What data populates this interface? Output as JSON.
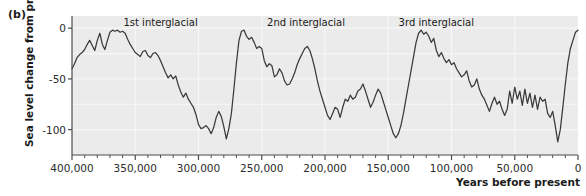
{
  "figure": {
    "panel_label": "(b)",
    "background_color": "#ffffff",
    "plot_background_color": "#ebebeb",
    "gridline_color": "#f7f7f7",
    "axis_color": "#4d4d4d",
    "line_color": "#3a3a3a"
  },
  "chart_data": {
    "type": "line",
    "title": "",
    "xlabel": "Years before present",
    "ylabel": "Sea level change from present (m)",
    "xlim": [
      400000,
      0
    ],
    "ylim": [
      -125,
      12
    ],
    "x_reversed": true,
    "grid": true,
    "legend_position": "none",
    "x_ticks": [
      400000,
      350000,
      300000,
      250000,
      200000,
      150000,
      100000,
      50000,
      0
    ],
    "x_tick_labels": [
      "400,000",
      "350,000",
      "300,000",
      "250,000",
      "200,000",
      "150,000",
      "100,000",
      "50,000",
      "0"
    ],
    "x_minor_tick_interval": 10000,
    "y_ticks": [
      0,
      -50,
      -100
    ],
    "y_tick_labels": [
      "0",
      "-50",
      "-100"
    ],
    "y_gridlines": [
      0,
      -25,
      -50,
      -75,
      -100,
      -125
    ],
    "annotations": [
      {
        "text": "1st interglacial",
        "x": 330000,
        "y": 5
      },
      {
        "text": "2nd interglacial",
        "x": 215000,
        "y": 5
      },
      {
        "text": "3rd interglacial",
        "x": 112000,
        "y": 5
      }
    ],
    "series": [
      {
        "name": "Sea level change from present",
        "units": "m",
        "x": [
          400000,
          398000,
          396000,
          394000,
          392000,
          390000,
          388000,
          386000,
          384000,
          382000,
          380000,
          378000,
          376000,
          374000,
          372000,
          370000,
          368000,
          366000,
          364000,
          362000,
          360000,
          358000,
          356000,
          354000,
          352000,
          350000,
          348000,
          346000,
          344000,
          342000,
          340000,
          338000,
          336000,
          334000,
          332000,
          330000,
          328000,
          326000,
          324000,
          322000,
          320000,
          318000,
          316000,
          314000,
          312000,
          310000,
          308000,
          306000,
          304000,
          302000,
          300000,
          298000,
          296000,
          294000,
          292000,
          290000,
          288000,
          286000,
          284000,
          282000,
          280000,
          278000,
          276000,
          274000,
          272000,
          270000,
          268000,
          266000,
          264000,
          262000,
          260000,
          258000,
          256000,
          254000,
          252000,
          250000,
          248000,
          246000,
          244000,
          242000,
          240000,
          238000,
          236000,
          234000,
          232000,
          230000,
          228000,
          226000,
          224000,
          222000,
          220000,
          218000,
          216000,
          214000,
          212000,
          210000,
          208000,
          206000,
          204000,
          202000,
          200000,
          198000,
          196000,
          194000,
          192000,
          190000,
          188000,
          186000,
          184000,
          182000,
          180000,
          178000,
          176000,
          174000,
          172000,
          170000,
          168000,
          166000,
          164000,
          162000,
          160000,
          158000,
          156000,
          154000,
          152000,
          150000,
          148000,
          146000,
          144000,
          142000,
          140000,
          138000,
          136000,
          134000,
          132000,
          130000,
          128000,
          126000,
          124000,
          122000,
          120000,
          118000,
          116000,
          114000,
          112000,
          110000,
          108000,
          106000,
          104000,
          102000,
          100000,
          98000,
          96000,
          94000,
          92000,
          90000,
          88000,
          86000,
          84000,
          82000,
          80000,
          78000,
          76000,
          74000,
          72000,
          70000,
          68000,
          66000,
          64000,
          62000,
          60000,
          58000,
          56000,
          54000,
          52000,
          50000,
          48000,
          46000,
          44000,
          42000,
          40000,
          38000,
          36000,
          34000,
          32000,
          30000,
          28000,
          26000,
          24000,
          22000,
          20000,
          18000,
          16000,
          14000,
          12000,
          10000,
          8000,
          6000,
          4000,
          2000,
          0
        ],
        "y": [
          -40,
          -35,
          -29,
          -26,
          -24,
          -21,
          -16,
          -12,
          -17,
          -22,
          -12,
          -5,
          -16,
          -21,
          -12,
          -4,
          -2,
          -3,
          -2,
          -4,
          -3,
          -5,
          -11,
          -16,
          -20,
          -24,
          -26,
          -28,
          -23,
          -22,
          -27,
          -29,
          -25,
          -24,
          -27,
          -32,
          -38,
          -44,
          -49,
          -46,
          -50,
          -47,
          -56,
          -63,
          -68,
          -64,
          -70,
          -74,
          -78,
          -85,
          -95,
          -99,
          -98,
          -96,
          -99,
          -104,
          -98,
          -88,
          -82,
          -87,
          -97,
          -109,
          -99,
          -84,
          -60,
          -34,
          -12,
          -3,
          -2,
          -8,
          -11,
          -9,
          -14,
          -20,
          -18,
          -20,
          -32,
          -38,
          -35,
          -37,
          -48,
          -46,
          -40,
          -44,
          -52,
          -56,
          -55,
          -50,
          -44,
          -36,
          -30,
          -25,
          -20,
          -18,
          -22,
          -30,
          -40,
          -52,
          -62,
          -70,
          -78,
          -86,
          -90,
          -84,
          -78,
          -80,
          -88,
          -78,
          -70,
          -72,
          -66,
          -70,
          -68,
          -62,
          -60,
          -55,
          -62,
          -70,
          -78,
          -73,
          -66,
          -60,
          -64,
          -72,
          -80,
          -88,
          -96,
          -104,
          -108,
          -104,
          -96,
          -84,
          -70,
          -56,
          -42,
          -28,
          -14,
          -5,
          -2,
          -6,
          -4,
          -8,
          -14,
          -10,
          -22,
          -28,
          -24,
          -30,
          -34,
          -31,
          -36,
          -34,
          -40,
          -44,
          -48,
          -46,
          -42,
          -52,
          -58,
          -56,
          -50,
          -60,
          -66,
          -70,
          -76,
          -82,
          -74,
          -68,
          -75,
          -72,
          -80,
          -86,
          -80,
          -62,
          -74,
          -58,
          -70,
          -62,
          -76,
          -60,
          -74,
          -64,
          -78,
          -66,
          -80,
          -68,
          -72,
          -70,
          -84,
          -88,
          -82,
          -96,
          -112,
          -100,
          -78,
          -55,
          -34,
          -20,
          -12,
          -4,
          -2
        ]
      }
    ]
  }
}
